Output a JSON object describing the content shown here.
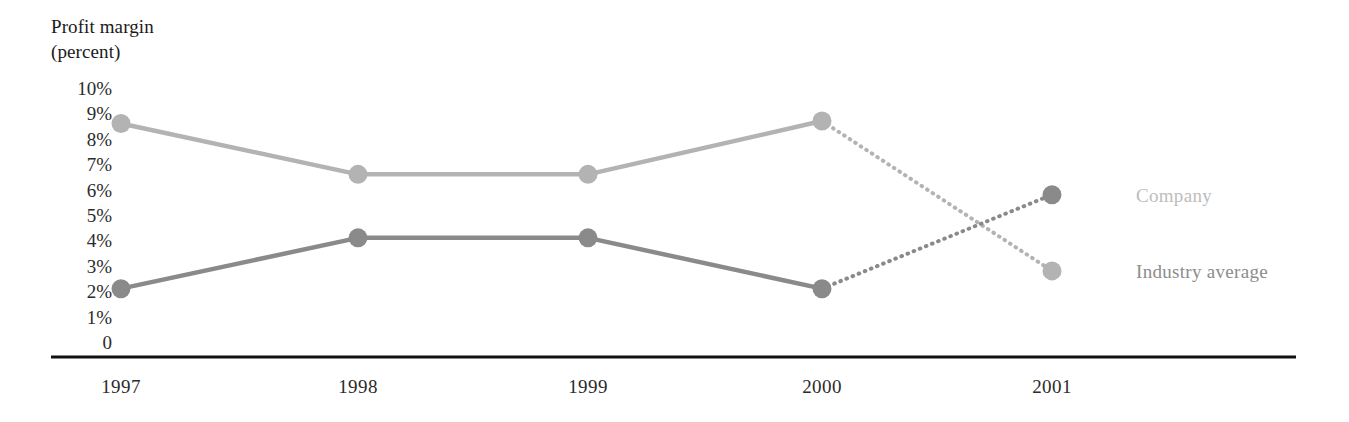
{
  "chart_data": {
    "type": "line",
    "title_line1": "Profit margin",
    "title_line2": "(percent)",
    "xlabel": "",
    "ylabel": "Profit margin (percent)",
    "categories": [
      "1997",
      "1998",
      "1999",
      "2000",
      "2001"
    ],
    "x_tick_labels": [
      "1997",
      "1998",
      "1999",
      "2000",
      "2001"
    ],
    "y_tick_labels": [
      "10%",
      "9%",
      "8%",
      "7%",
      "6%",
      "5%",
      "4%",
      "3%",
      "2%",
      "1%",
      "0"
    ],
    "y_tick_values": [
      10,
      9,
      8,
      7,
      6,
      5,
      4,
      3,
      2,
      1,
      0
    ],
    "ylim": [
      0,
      10
    ],
    "grid": false,
    "legend_position": "right",
    "series": [
      {
        "name": "Industry average",
        "color": "#b3b3b3",
        "values": [
          8.6,
          6.6,
          6.6,
          8.7,
          2.8
        ],
        "projected_from_index": 3,
        "label": "Industry average",
        "label_color": "#8c8c8c"
      },
      {
        "name": "Company",
        "color": "#8a8a8a",
        "values": [
          2.1,
          4.1,
          4.1,
          2.1,
          5.8
        ],
        "projected_from_index": 3,
        "label": "Company",
        "label_color": "#bdbdbd"
      }
    ],
    "annotations": [
      "Dotted segments from 2000 to 2001 indicate projected values"
    ]
  },
  "legend": {
    "industry_average": "Industry average",
    "company": "Company"
  },
  "colors": {
    "industry_line": "#b3b3b3",
    "company_line": "#8a8a8a",
    "axis": "#111111",
    "tick_text": "#2b2b2b",
    "industry_label": "#8c8c8c",
    "company_label": "#bdbdbd"
  }
}
